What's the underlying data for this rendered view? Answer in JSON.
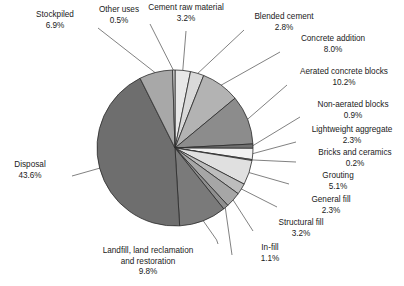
{
  "figure": {
    "name": "pie-chart-uses-of-material",
    "background": "#ffffff",
    "outline_color": "#2b2b2b"
  },
  "chart_data": {
    "type": "pie",
    "title": "",
    "subtitle": "",
    "xlabel": "",
    "ylabel": "",
    "legend_position": "none",
    "grid": false,
    "start_angle_deg": 0,
    "direction": "clockwise",
    "units": "percent",
    "total": 100.0,
    "categories": [
      "Cement raw material",
      "Blended cement",
      "Concrete addition",
      "Aerated concrete blocks",
      "Non-aerated blocks",
      "Lightweight aggregate",
      "Bricks and ceramics",
      "Grouting",
      "General fill",
      "Structural fill",
      "In-fill",
      "Landfill, land reclamation and restoration",
      "Disposal",
      "Stockpiled",
      "Other uses"
    ],
    "values": [
      3.2,
      2.8,
      8.0,
      10.2,
      0.9,
      2.3,
      0.2,
      5.1,
      2.3,
      3.2,
      1.1,
      9.8,
      43.6,
      6.9,
      0.5
    ],
    "value_labels": [
      "3.2%",
      "2.8%",
      "8.0%",
      "10.2%",
      "0.9%",
      "2.3%",
      "0.2%",
      "5.1%",
      "2.3%",
      "3.2%",
      "1.1%",
      "9.8%",
      "43.6%",
      "6.9%",
      "0.5%"
    ],
    "slice_colors": [
      "#e8e8e8",
      "#d9d9d9",
      "#b3b3b3",
      "#8c8c8c",
      "#707070",
      "#f2f2f2",
      "#c4c4c4",
      "#e0e0e0",
      "#bdbdbd",
      "#a6a6a6",
      "#8f8f8f",
      "#7a7a7a",
      "#6e6e6e",
      "#a8a8a8",
      "#cfcfcf"
    ]
  },
  "labels": [
    {
      "name": "label-stockpiled",
      "line1": "Stockpiled",
      "line2": "",
      "pct": "6.9%"
    },
    {
      "name": "label-other-uses",
      "line1": "Other uses",
      "line2": "",
      "pct": "0.5%"
    },
    {
      "name": "label-cement-raw-material",
      "line1": "Cement raw material",
      "line2": "",
      "pct": "3.2%"
    },
    {
      "name": "label-blended-cement",
      "line1": "Blended cement",
      "line2": "",
      "pct": "2.8%"
    },
    {
      "name": "label-concrete-addition",
      "line1": "Concrete addition",
      "line2": "",
      "pct": "8.0%"
    },
    {
      "name": "label-aerated-concrete-blocks",
      "line1": "Aerated concrete blocks",
      "line2": "",
      "pct": "10.2%"
    },
    {
      "name": "label-non-aerated-blocks",
      "line1": "Non-aerated blocks",
      "line2": "",
      "pct": "0.9%"
    },
    {
      "name": "label-lightweight-aggregate",
      "line1": "Lightweight aggregate",
      "line2": "",
      "pct": "2.3%"
    },
    {
      "name": "label-bricks-and-ceramics",
      "line1": "Bricks and ceramics",
      "line2": "",
      "pct": "0.2%"
    },
    {
      "name": "label-grouting",
      "line1": "Grouting",
      "line2": "",
      "pct": "5.1%"
    },
    {
      "name": "label-general-fill",
      "line1": "General fill",
      "line2": "",
      "pct": "2.3%"
    },
    {
      "name": "label-structural-fill",
      "line1": "Structural fill",
      "line2": "",
      "pct": "3.2%"
    },
    {
      "name": "label-in-fill",
      "line1": "In-fill",
      "line2": "",
      "pct": "1.1%"
    },
    {
      "name": "label-landfill",
      "line1": "Landfill, land reclamation",
      "line2": "and restoration",
      "pct": "9.8%"
    },
    {
      "name": "label-disposal",
      "line1": "Disposal",
      "line2": "",
      "pct": "43.6%"
    }
  ]
}
